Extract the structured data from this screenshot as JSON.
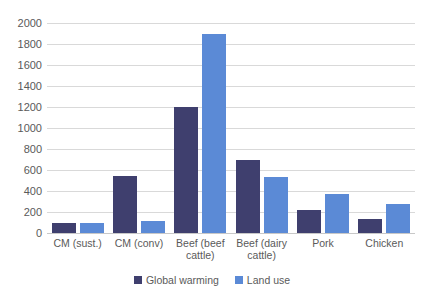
{
  "chart_data": {
    "type": "bar",
    "title": "",
    "subtitle": "",
    "xlabel": "",
    "ylabel": "",
    "categories": [
      "CM (sust.)",
      "CM (conv)",
      "Beef (beef cattle)",
      "Beef (dairy cattle)",
      "Pork",
      "Chicken"
    ],
    "series": [
      {
        "name": "Global warming",
        "color": "#3f3f6e",
        "values": [
          100,
          540,
          1200,
          700,
          215,
          130
        ]
      },
      {
        "name": "Land use",
        "color": "#5b8ad6",
        "values": [
          100,
          110,
          1900,
          530,
          370,
          280
        ]
      }
    ],
    "ylim": [
      0,
      2000
    ],
    "ytick_step": 200,
    "yticks": [
      0,
      200,
      400,
      600,
      800,
      1000,
      1200,
      1400,
      1600,
      1800,
      2000
    ],
    "ytick_labels": [
      "0",
      "200",
      "400",
      "600",
      "800",
      "1000",
      "1200",
      "1400",
      "1600",
      "1800",
      "2000"
    ],
    "grid": true,
    "grid_color": "#d9d9d9",
    "legend_position": "bottom",
    "background": "#ffffff",
    "axis_text_color": "#5a5a5a"
  }
}
